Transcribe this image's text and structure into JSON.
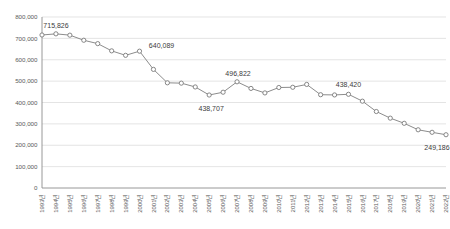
{
  "chart_data": {
    "type": "line",
    "title": "",
    "subtitle": "",
    "xlabel": "",
    "ylabel": "",
    "grid": true,
    "legend": false,
    "ylim": [
      0,
      800000
    ],
    "ytick_values": [
      0,
      100000,
      200000,
      300000,
      400000,
      500000,
      600000,
      700000,
      800000
    ],
    "ytick_labels": [
      "0",
      "100,000",
      "200,000",
      "300,000",
      "400,000",
      "500,000",
      "600,000",
      "700,000",
      "800,000"
    ],
    "categories": [
      "1993년",
      "1994년",
      "1995년",
      "1996년",
      "1997년",
      "1998년",
      "1999년",
      "2000년",
      "2001년",
      "2002년",
      "2003년",
      "2004년",
      "2005년",
      "2006년",
      "2007년",
      "2008년",
      "2009년",
      "2010년",
      "2011년",
      "2012년",
      "2013년",
      "2014년",
      "2015년",
      "2016년",
      "2017년",
      "2018년",
      "2019년",
      "2020년",
      "2021년",
      "2022년"
    ],
    "values": [
      715826,
      721185,
      715020,
      691226,
      675394,
      641594,
      620668,
      640089,
      554895,
      492111,
      490543,
      472761,
      435031,
      448153,
      496822,
      465892,
      444849,
      470171,
      471265,
      484550,
      436455,
      435435,
      438420,
      406243,
      357771,
      326822,
      302676,
      272337,
      260562,
      249186
    ],
    "annotated_labels": [
      {
        "index": 0,
        "text": "715,826"
      },
      {
        "index": 7,
        "text": "640,089"
      },
      {
        "index": 12,
        "text": "438,707"
      },
      {
        "index": 14,
        "text": "496,822"
      },
      {
        "index": 22,
        "text": "438,420"
      },
      {
        "index": 29,
        "text": "249,186"
      }
    ],
    "colors": {
      "line": "#8c8c8c",
      "marker_fill": "#ffffff",
      "marker_stroke": "#7a7a7a",
      "grid": "#d9d9d9",
      "axis": "#8c8c8c",
      "tick_text": "#5a5a5a",
      "label_text": "#3c3c3c",
      "background": "#ffffff"
    }
  }
}
